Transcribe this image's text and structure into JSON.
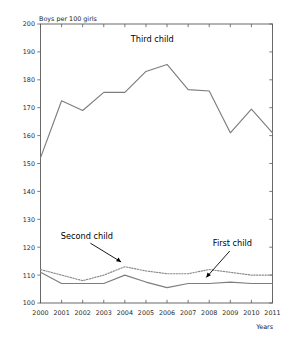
{
  "chart_data": {
    "type": "line",
    "title": "",
    "ylabel": "Boys per 100 girls",
    "xlabel": "Years",
    "grid": false,
    "legend_position": "inline-annotations",
    "x": [
      2000,
      2001,
      2002,
      2003,
      2004,
      2005,
      2006,
      2007,
      2008,
      2009,
      2010,
      2011
    ],
    "categories": [
      "2000",
      "2001",
      "2002",
      "2003",
      "2004",
      "2005",
      "2006",
      "2007",
      "2008",
      "2009",
      "2010",
      "2011"
    ],
    "xlim": [
      2000,
      2011
    ],
    "ylim": [
      100,
      200
    ],
    "ytick_labels": [
      "100",
      "110",
      "120",
      "130",
      "140",
      "150",
      "160",
      "170",
      "180",
      "190",
      "200"
    ],
    "yticks": [
      100,
      110,
      120,
      130,
      140,
      150,
      160,
      170,
      180,
      190,
      200
    ],
    "series": [
      {
        "name": "Third child",
        "style": "solid",
        "color": "#7d7d7d",
        "values": [
          152.0,
          172.5,
          169.0,
          175.5,
          175.5,
          183.0,
          185.5,
          176.5,
          176.0,
          161.0,
          169.5,
          161.0
        ]
      },
      {
        "name": "Second child",
        "style": "dotted",
        "color": "#8a8a8a",
        "values": [
          112.0,
          110.0,
          108.0,
          110.0,
          113.0,
          111.5,
          110.5,
          110.5,
          112.0,
          111.0,
          110.0,
          110.0
        ]
      },
      {
        "name": "First child",
        "style": "solid",
        "color": "#7d7d7d",
        "values": [
          111.0,
          107.0,
          107.0,
          107.0,
          110.0,
          107.5,
          105.5,
          107.0,
          107.0,
          107.5,
          107.0,
          107.0
        ]
      }
    ],
    "annotations": [
      {
        "text": "Third child",
        "label_x": 2005.3,
        "label_y": 193.5,
        "point_x": 2005.3,
        "point_y": 193.5,
        "arrow": false
      },
      {
        "text": "Second child",
        "label_x": 2002.2,
        "label_y": 123.0,
        "point_x": 2003.9,
        "point_y": 114.3,
        "arrow": true
      },
      {
        "text": "First child",
        "label_x": 2009.1,
        "label_y": 120.5,
        "point_x": 2007.8,
        "point_y": 108.6,
        "arrow": true
      }
    ]
  }
}
